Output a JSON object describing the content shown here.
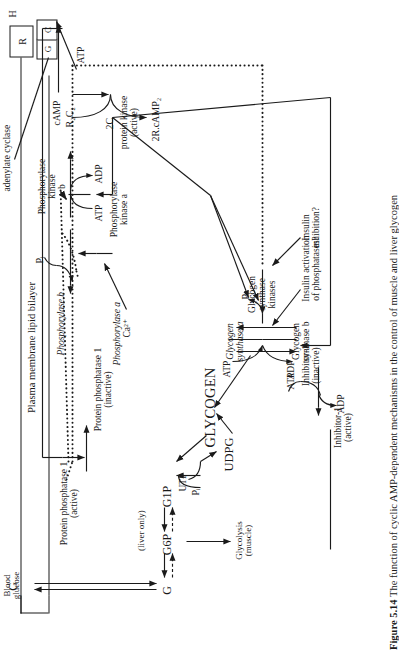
{
  "figure": {
    "caption_label": "Figure 5.14",
    "caption_text": "The function of cyclic AMP-dependent mechanisms in the control of muscle and liver glycogen"
  },
  "membrane": {
    "label": "Plasma membrane lipid bilayer",
    "hormone_label": "H",
    "receptor_r": "R",
    "receptor_g": "G",
    "receptor_c": "C",
    "enzyme_label": "adenylate cyclase"
  },
  "camp_cascade": {
    "atp": "ATP",
    "camp": "cAMP",
    "r2c2": "R₂C₂",
    "two_c": "2C",
    "protein_kinase": "protein kinase\n(active)",
    "r_camp": "2R.cAMP₂"
  },
  "phosphorylase": {
    "kinase_b": "Phosphorylase\nkinase\nb",
    "kinase_a": "Phosphorylase\nkinase a",
    "atp": "ATP",
    "adp": "ADP",
    "calcium": "Ca²⁺",
    "pi": "Pᵢ",
    "phos_b": "Phosphorylase b",
    "phos_a": "Phosphorylase a",
    "atp2": "ATP",
    "adp2": "ADP"
  },
  "phosphatase": {
    "active": "Protein phosphatase 1\n(active)",
    "inactive": "Protein phosphatase 1\n(inactive)"
  },
  "glycogen": {
    "label": "GLYCOGEN",
    "pi": "Pᵢ",
    "g1p": "G1P",
    "g6p": "G6P",
    "g": "G",
    "g_top": "G",
    "utp": "UTP",
    "udpg": "UDPG",
    "liver_only": "(liver only)",
    "glycolysis": "Glycolysis\n(muscle)",
    "blood_glucose": "Blood\nglucose"
  },
  "synthase": {
    "kinases": "Glycogen\nsynthase\nkinases",
    "synthase_a": "Glycogen\nsynthase a",
    "synthase_b": "Glycogen\nsynthase b",
    "atp": "ATP",
    "adp": "ADP",
    "pi": "Pᵢ",
    "insulin_inhibition": "Insulin\ninhibition?",
    "insulin_activation": "Insulin activation\nof phosphatases?"
  },
  "inhibitor": {
    "inactive": "Inhibitor-1\n(inactive)",
    "active": "Inhibitor-1\n(active)",
    "atp": "ATP",
    "adp": "ADP"
  },
  "colors": {
    "ink": "#1a1a1a",
    "paper": "#ffffff"
  }
}
